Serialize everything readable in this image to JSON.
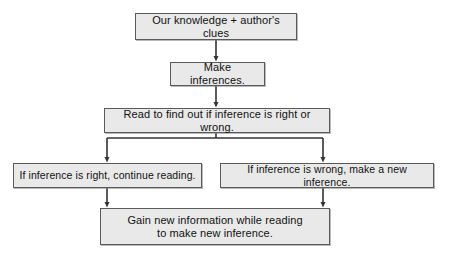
{
  "diagram": {
    "type": "flowchart",
    "orientation": "top-down",
    "colors": {
      "node_fill": "#e9e9e9",
      "node_border": "#5a5a5a",
      "connector": "#333333",
      "text": "#111111",
      "background": "#ffffff"
    },
    "nodes": [
      {
        "id": "source",
        "label": "Our knowledge + author's clues",
        "shape": "rectangle",
        "level": 0
      },
      {
        "id": "make",
        "label": "Make inferences.",
        "shape": "rectangle",
        "level": 1
      },
      {
        "id": "read",
        "label": "Read to find out if inference is right or wrong.",
        "shape": "rectangle",
        "level": 2
      },
      {
        "id": "right",
        "label": "If inference is right, continue reading.",
        "shape": "rectangle",
        "level": 3,
        "branch": "left"
      },
      {
        "id": "wrong",
        "label": "If inference is wrong, make a new inference.",
        "shape": "rectangle",
        "level": 3,
        "branch": "right"
      },
      {
        "id": "gain",
        "label": "Gain new information while reading\nto make new inference.",
        "shape": "rectangle",
        "level": 4
      }
    ],
    "edges": [
      {
        "id": "e1",
        "from": "source",
        "to": "make",
        "style": "straight-arrow"
      },
      {
        "id": "e2",
        "from": "make",
        "to": "read",
        "style": "straight-arrow"
      },
      {
        "id": "e3",
        "from": "read",
        "to": "right",
        "style": "elbow-arrow"
      },
      {
        "id": "e4",
        "from": "read",
        "to": "wrong",
        "style": "elbow-arrow"
      },
      {
        "id": "e5",
        "from": "right",
        "to": "gain",
        "style": "straight-arrow"
      },
      {
        "id": "e6",
        "from": "wrong",
        "to": "gain",
        "style": "straight-arrow"
      }
    ]
  }
}
